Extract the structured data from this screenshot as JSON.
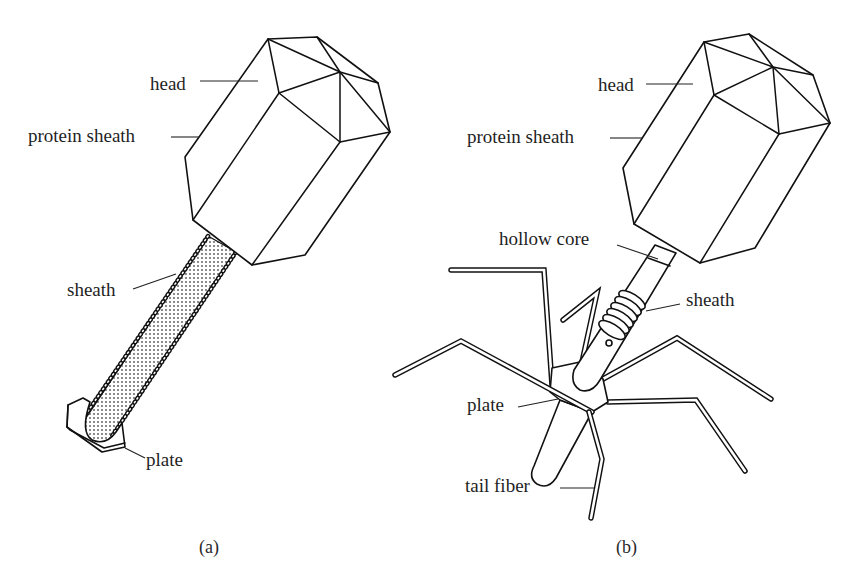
{
  "figure": {
    "panels": [
      {
        "caption": "(a)",
        "labels": {
          "head": "head",
          "protein_sheath": "protein sheath",
          "sheath": "sheath",
          "plate": "plate"
        }
      },
      {
        "caption": "(b)",
        "labels": {
          "head": "head",
          "protein_sheath": "protein sheath",
          "hollow_core": "hollow core",
          "sheath": "sheath",
          "plate": "plate",
          "tail_fiber": "tail fiber"
        }
      }
    ]
  },
  "colors": {
    "ink": "#111111",
    "background": "#ffffff",
    "tail_fill": "#d9d9d9"
  }
}
